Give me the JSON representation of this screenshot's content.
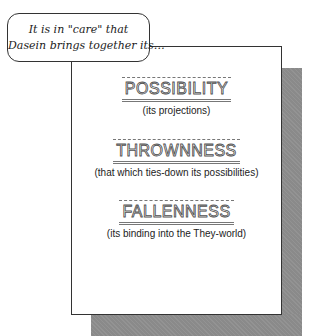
{
  "callout": {
    "line1": "It is in \"care\" that",
    "line2": "Dasein brings together its…"
  },
  "terms": [
    {
      "title": "POSSIBILITY",
      "subtitle": "(its projections)"
    },
    {
      "title": "THROWNNESS",
      "subtitle": "(that which ties-down its possibilities)"
    },
    {
      "title": "FALLENNESS",
      "subtitle": "(its binding into the They-world)"
    }
  ],
  "colors": {
    "shadow": "#8a8a8a",
    "border": "#333333",
    "background": "#ffffff"
  }
}
